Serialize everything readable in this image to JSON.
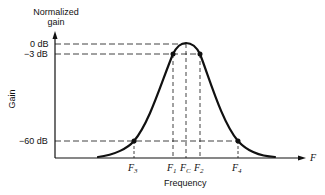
{
  "diagram": {
    "y_axis_title_line1": "Normalized",
    "y_axis_title_line2": "gain",
    "y_axis_label": "Gain",
    "x_axis_label": "Frequency",
    "x_axis_arrow_label": "F",
    "y_ticks": [
      {
        "label": "0 dB"
      },
      {
        "label": "−3 dB"
      },
      {
        "label": "−60 dB"
      }
    ],
    "x_markers": [
      {
        "base": "F",
        "sub": "3"
      },
      {
        "base": "F",
        "sub": "1"
      },
      {
        "base": "F",
        "sub": "C"
      },
      {
        "base": "F",
        "sub": "2"
      },
      {
        "base": "F",
        "sub": "4"
      }
    ],
    "colors": {
      "line": "#111111",
      "background": "#ffffff"
    }
  }
}
